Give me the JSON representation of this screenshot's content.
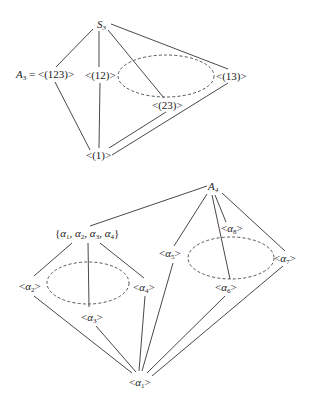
{
  "top_diagram": {
    "title": "Subgroup lattice of S3",
    "nodes": {
      "s3": {
        "main": "S",
        "sub": "3"
      },
      "a3": {
        "prefix": "A",
        "sub": "3",
        "rest": " = <(123)>"
      },
      "c12": {
        "text": "<(12)>"
      },
      "c13": {
        "text": "<(13)>"
      },
      "c23": {
        "text": "<(23)>"
      },
      "trivial": {
        "text": "<(1)>"
      }
    },
    "edges": [
      [
        "S3",
        "A3"
      ],
      [
        "S3",
        "<(12)>"
      ],
      [
        "S3",
        "<(23)>"
      ],
      [
        "S3",
        "<(13)>"
      ],
      [
        "A3",
        "<(1)>"
      ],
      [
        "<(12)>",
        "<(1)>"
      ],
      [
        "<(23)>",
        "<(1)>"
      ],
      [
        "<(13)>",
        "<(1)>"
      ]
    ],
    "conjugacy_class_ellipse": [
      "<(12)>",
      "<(23)>",
      "<(13)>"
    ]
  },
  "bottom_diagram": {
    "title": "Subgroup lattice of A4",
    "nodes": {
      "a4": {
        "main": "A",
        "sub": "4"
      },
      "klein": {
        "open": "{",
        "items": [
          {
            "g": "α",
            "s": "1"
          },
          {
            "g": "α",
            "s": "2"
          },
          {
            "g": "α",
            "s": "3"
          },
          {
            "g": "α",
            "s": "4"
          }
        ],
        "close": "}"
      },
      "al2": {
        "g": "α",
        "s": "2"
      },
      "al3": {
        "g": "α",
        "s": "3"
      },
      "al4": {
        "g": "α",
        "s": "4"
      },
      "al5": {
        "g": "α",
        "s": "5"
      },
      "al6": {
        "g": "α",
        "s": "6"
      },
      "al7": {
        "g": "α",
        "s": "7"
      },
      "al8": {
        "g": "α",
        "s": "8"
      },
      "al1": {
        "g": "α",
        "s": "1"
      }
    },
    "brackets": {
      "open": "<",
      "close": ">"
    },
    "edges": [
      [
        "A4",
        "{α1,α2,α3,α4}"
      ],
      [
        "A4",
        "<α5>"
      ],
      [
        "A4",
        "<α8>"
      ],
      [
        "A4",
        "<α6>"
      ],
      [
        "A4",
        "<α7>"
      ],
      [
        "{α1,α2,α3,α4}",
        "<α2>"
      ],
      [
        "{α1,α2,α3,α4}",
        "<α3>"
      ],
      [
        "{α1,α2,α3,α4}",
        "<α4>"
      ],
      [
        "<α2>",
        "<α1>"
      ],
      [
        "<α3>",
        "<α1>"
      ],
      [
        "<α4>",
        "<α1>"
      ],
      [
        "<α5>",
        "<α1>"
      ],
      [
        "<α6>",
        "<α1>"
      ],
      [
        "<α7>",
        "<α1>"
      ]
    ],
    "conjugacy_class_ellipses": [
      [
        "<α2>",
        "<α3>",
        "<α4>"
      ],
      [
        "<α5>",
        "<α6>",
        "<α7>",
        "<α8>"
      ]
    ]
  }
}
